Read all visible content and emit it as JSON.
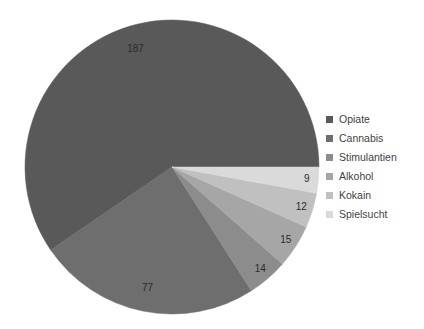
{
  "chart_data": {
    "type": "pie",
    "title": "",
    "xlabel": "",
    "ylabel": "",
    "grid": false,
    "legend_position": "right",
    "total": 314,
    "start_angle_deg": 0,
    "direction": "counterclockwise",
    "categories": [
      "Opiate",
      "Cannabis",
      "Stimulantien",
      "Alkohol",
      "Kokain",
      "Spielsucht"
    ],
    "values": [
      187,
      77,
      14,
      15,
      12,
      9
    ],
    "colors": [
      "#595959",
      "#6e6e6e",
      "#8c8c8c",
      "#a6a6a6",
      "#c0c0c0",
      "#dadada"
    ],
    "slices": [
      {
        "label": "Opiate",
        "value": 187,
        "value_text": "187",
        "color": "#595959"
      },
      {
        "label": "Cannabis",
        "value": 77,
        "value_text": "77",
        "color": "#6e6e6e"
      },
      {
        "label": "Stimulantien",
        "value": 14,
        "value_text": "14",
        "color": "#8c8c8c"
      },
      {
        "label": "Alkohol",
        "value": 15,
        "value_text": "15",
        "color": "#a6a6a6"
      },
      {
        "label": "Kokain",
        "value": 12,
        "value_text": "12",
        "color": "#c0c0c0"
      },
      {
        "label": "Spielsucht",
        "value": 9,
        "value_text": "9",
        "color": "#dadada"
      }
    ]
  },
  "legend": {
    "items": [
      {
        "label": "Opiate",
        "color": "#595959"
      },
      {
        "label": "Cannabis",
        "color": "#6e6e6e"
      },
      {
        "label": "Stimulantien",
        "color": "#8c8c8c"
      },
      {
        "label": "Alkohol",
        "color": "#a6a6a6"
      },
      {
        "label": "Kokain",
        "color": "#c0c0c0"
      },
      {
        "label": "Spielsucht",
        "color": "#dadada"
      }
    ]
  }
}
